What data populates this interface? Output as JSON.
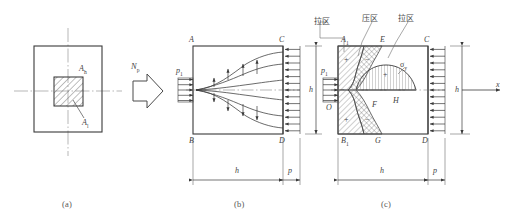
{
  "figure": {
    "captions": [
      {
        "key": "a",
        "text": "(a)"
      },
      {
        "key": "b",
        "text": "(b)"
      },
      {
        "key": "c",
        "text": "(c)"
      }
    ]
  },
  "panel_a": {
    "name": "cross-section",
    "labels": {
      "anchor_area_h": "A",
      "anchor_area_h_sub": "h",
      "anchor_area_l": "A",
      "anchor_area_l_sub": "l"
    }
  },
  "transition": {
    "force_symbol": "N",
    "force_sub": "p"
  },
  "panel_b": {
    "name": "stress-diffusion",
    "corners": {
      "top_left": "A",
      "top_right": "C",
      "bottom_left": "B",
      "bottom_right": "D"
    },
    "load_label": "p",
    "load_sub": "1",
    "dim_height": "h",
    "dim_length": "h",
    "dim_edge": "p",
    "arrow_count_in": 5,
    "arrow_count_out": 13
  },
  "panel_c": {
    "name": "transverse-stress-distribution",
    "zone_labels": [
      {
        "text": "拉区",
        "meaning": "tension-zone"
      },
      {
        "text": "压区",
        "meaning": "compression-zone"
      },
      {
        "text": "拉区",
        "meaning": "tension-zone"
      }
    ],
    "points": {
      "A1": "A",
      "A1_sub": "1",
      "E": "E",
      "C": "C",
      "O": "O",
      "F": "F",
      "H": "H",
      "B1": "B",
      "B1_sub": "1",
      "G": "G",
      "D": "D"
    },
    "stress_symbol": "σ",
    "stress_sub": "y",
    "load_label": "p",
    "load_sub": "1",
    "axis_label": "x",
    "dim_height": "h",
    "dim_length": "h",
    "dim_edge": "p",
    "signs": {
      "upper_tension": "+",
      "upper_compression": "−",
      "mid_left": "−",
      "bulge": "+",
      "lower_tension": "+",
      "lower_compression": "−"
    },
    "arrow_count_in": 5,
    "arrow_count_out": 13
  },
  "colors": {
    "line": "#3a3a3a",
    "thin": "#6d6d6d",
    "center": "#9a9a9a",
    "text": "#3f3f3f",
    "hatch": "#555555"
  }
}
